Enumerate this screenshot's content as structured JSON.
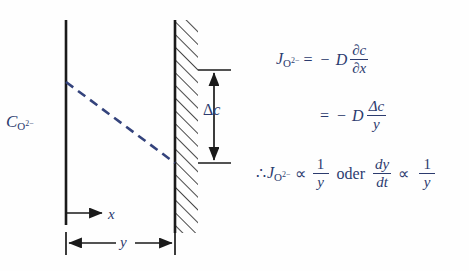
{
  "figure": {
    "background_color": "#fefefe",
    "line_color": "#1a1a1a",
    "annotation_color": "#2c3b6e",
    "dashed_profile_color": "#34437c"
  },
  "diagram": {
    "concentration_axis_label": {
      "base": "C",
      "subscript": "O",
      "subscript_superscript": "2−"
    },
    "delta_c_label": {
      "symbol": "Δ",
      "variable": "c"
    },
    "x_axis_label": "x",
    "y_dimension_label": "y",
    "left_axis": {
      "x": 66,
      "y_top": 20,
      "y_bottom": 225
    },
    "wall": {
      "x_face": 174,
      "y_top": 20,
      "y_bottom": 233,
      "hatch_width": 22,
      "hatch_angle_deg": 45
    },
    "profile_line": {
      "x1": 66,
      "y1": 82,
      "x2": 174,
      "y2": 163,
      "style": "dashed"
    },
    "delta_c_arrow": {
      "x": 213,
      "y_top": 70,
      "y_bottom": 163
    },
    "x_arrow": {
      "x_start": 66,
      "x_end": 103,
      "y": 213
    },
    "y_arrow": {
      "x_start": 66,
      "x_end": 174,
      "y": 243
    }
  },
  "equations": {
    "line1": {
      "lhs_base": "J",
      "lhs_sub": "O",
      "lhs_sub_sup": "2−",
      "equals": "=",
      "minus": "−",
      "coefficient": "D",
      "numerator": "∂c",
      "denominator": "∂x"
    },
    "line2": {
      "equals": "=",
      "minus": "−",
      "coefficient": "D",
      "numerator": "Δc",
      "denominator": "y"
    },
    "line3": {
      "therefore": "∴",
      "lhs_base": "J",
      "lhs_sub": "O",
      "lhs_sub_sup": "2−",
      "proportional": "∝",
      "frac1_num": "1",
      "frac1_den": "y",
      "conjunction": "oder",
      "frac2_num": "dy",
      "frac2_den": "dt",
      "proportional2": "∝",
      "frac3_num": "1",
      "frac3_den": "y"
    }
  }
}
